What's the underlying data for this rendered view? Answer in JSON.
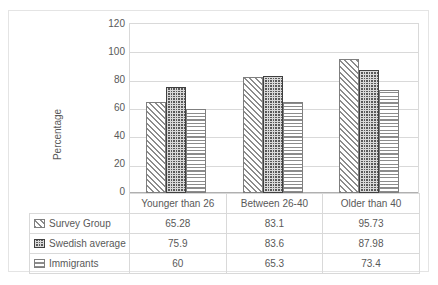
{
  "chart_data": {
    "type": "bar",
    "title": "",
    "xlabel": "",
    "ylabel": "Percentage",
    "ylim": [
      0,
      120
    ],
    "yticks": [
      0,
      20,
      40,
      60,
      80,
      100,
      120
    ],
    "grid": true,
    "legend_position": "data-table",
    "categories": [
      "Younger than 26",
      "Between 26-40",
      "Older than 40"
    ],
    "series": [
      {
        "name": "Survey Group",
        "pattern": "diagonal-hatch",
        "values": [
          65.28,
          83.1,
          95.73
        ],
        "labels": [
          "65.28",
          "83.1",
          "95.73"
        ]
      },
      {
        "name": "Swedish average",
        "pattern": "dark-grid",
        "values": [
          75.9,
          83.6,
          87.98
        ],
        "labels": [
          "75.9",
          "83.6",
          "87.98"
        ]
      },
      {
        "name": "Immigrants",
        "pattern": "horizontal-lines",
        "values": [
          60,
          65.3,
          73.4
        ],
        "labels": [
          "60",
          "65.3",
          "73.4"
        ]
      }
    ]
  },
  "axis": {
    "y_ticks": [
      "120",
      "100",
      "80",
      "60",
      "40",
      "20",
      "0"
    ],
    "y_title": "Percentage"
  },
  "table": {
    "categories": [
      "Younger than 26",
      "Between 26-40",
      "Older than 40"
    ],
    "rows": [
      {
        "label": "Survey Group",
        "values": [
          "65.28",
          "83.1",
          "95.73"
        ]
      },
      {
        "label": "Swedish average",
        "values": [
          "75.9",
          "83.6",
          "87.98"
        ]
      },
      {
        "label": "Immigrants",
        "values": [
          "60",
          "65.3",
          "73.4"
        ]
      }
    ]
  },
  "colors": {
    "grid": "#d9d9d9",
    "text": "#595959",
    "bar_light": "#8c8c8c",
    "bar_dark": "#595959",
    "border": "#e4e4e4"
  }
}
